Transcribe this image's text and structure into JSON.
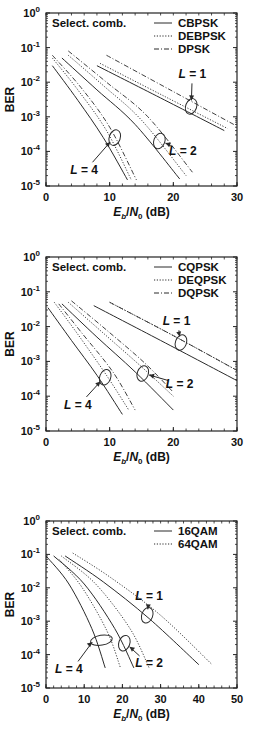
{
  "chart_data": [
    {
      "type": "line",
      "id": "bpsk",
      "annotation": "Select. comb.",
      "xlabel": "E_b/N_0 (dB)",
      "ylabel": "BER",
      "xlim": [
        0,
        30
      ],
      "ylim": [
        1e-05,
        1
      ],
      "yscale": "log",
      "xticks": [
        0,
        10,
        20,
        30
      ],
      "yticks_exp": [
        0,
        -1,
        -2,
        -3,
        -4,
        -5
      ],
      "grid": false,
      "legend_position": "upper right",
      "legend": [
        {
          "name": "CBPSK",
          "style": "solid"
        },
        {
          "name": "DEBPSK",
          "style": "dotted"
        },
        {
          "name": "DPSK",
          "style": "dashdot"
        }
      ],
      "series": [
        {
          "name": "CBPSK",
          "L": 1,
          "style": "solid",
          "points": [
            [
              8,
              0.03
            ],
            [
              18,
              0.0035
            ],
            [
              28,
              0.0004
            ]
          ]
        },
        {
          "name": "DEBPSK",
          "L": 1,
          "style": "dotted",
          "points": [
            [
              8.5,
              0.035
            ],
            [
              18.5,
              0.004
            ],
            [
              28.5,
              0.00046
            ]
          ]
        },
        {
          "name": "DPSK",
          "L": 1,
          "style": "dashdot",
          "points": [
            [
              9.5,
              0.06
            ],
            [
              19.5,
              0.006
            ],
            [
              29.5,
              0.0006
            ]
          ]
        },
        {
          "name": "CBPSK",
          "L": 2,
          "style": "solid",
          "points": [
            [
              2.5,
              0.05
            ],
            [
              8,
              0.006
            ],
            [
              14,
              0.0006
            ],
            [
              21,
              1.6e-05
            ]
          ]
        },
        {
          "name": "DEBPSK",
          "L": 2,
          "style": "dotted",
          "points": [
            [
              3.5,
              0.06
            ],
            [
              9,
              0.008
            ],
            [
              15,
              0.0008
            ],
            [
              22,
              2e-05
            ]
          ]
        },
        {
          "name": "DPSK",
          "L": 2,
          "style": "dashdot",
          "points": [
            [
              3.5,
              0.08
            ],
            [
              9.5,
              0.01
            ],
            [
              16,
              0.001
            ],
            [
              23,
              2.5e-05
            ]
          ]
        },
        {
          "name": "CBPSK",
          "L": 4,
          "style": "solid",
          "points": [
            [
              1,
              0.03
            ],
            [
              5,
              0.003
            ],
            [
              9,
              0.00025
            ],
            [
              12.8,
              1.5e-05
            ]
          ]
        },
        {
          "name": "DEBPSK",
          "L": 4,
          "style": "dotted",
          "points": [
            [
              1,
              0.05
            ],
            [
              5,
              0.006
            ],
            [
              9.5,
              0.0004
            ],
            [
              13.4,
              1.5e-05
            ]
          ]
        },
        {
          "name": "DPSK",
          "L": 4,
          "style": "dashdot",
          "points": [
            [
              1,
              0.06
            ],
            [
              5.5,
              0.007
            ],
            [
              10,
              0.0005
            ],
            [
              14.2,
              1.5e-05
            ]
          ]
        }
      ],
      "annotations": [
        {
          "text": "L = 1",
          "x": 23,
          "y": 0.018,
          "ellipse_at": [
            22.8,
            0.002
          ]
        },
        {
          "text": "L = 2",
          "x": 21.5,
          "y": 0.00011,
          "ellipse_at": [
            17.8,
            0.0002
          ]
        },
        {
          "text": "L = 4",
          "x": 6,
          "y": 3e-05,
          "ellipse_at": [
            10.8,
            0.00025
          ]
        }
      ]
    },
    {
      "type": "line",
      "id": "qpsk",
      "annotation": "Select. comb.",
      "xlabel": "E_b/N_0 (dB)",
      "ylabel": "BER",
      "xlim": [
        0,
        30
      ],
      "ylim": [
        1e-05,
        1
      ],
      "yscale": "log",
      "xticks": [
        0,
        10,
        20,
        30
      ],
      "yticks_exp": [
        0,
        -1,
        -2,
        -3,
        -4,
        -5
      ],
      "grid": false,
      "legend_position": "upper right",
      "legend": [
        {
          "name": "CQPSK",
          "style": "solid"
        },
        {
          "name": "DEQPSK",
          "style": "dotted"
        },
        {
          "name": "DQPSK",
          "style": "dashdot"
        }
      ],
      "series": [
        {
          "name": "CQPSK",
          "L": 1,
          "style": "solid",
          "points": [
            [
              7.5,
              0.04
            ],
            [
              18,
              0.004
            ],
            [
              30,
              0.00028
            ]
          ]
        },
        {
          "name": "DEQPSK",
          "L": 1,
          "style": "dotted",
          "points": [
            [
              10,
              0.05
            ],
            [
              20,
              0.0055
            ],
            [
              30,
              0.00055
            ]
          ]
        },
        {
          "name": "DQPSK",
          "L": 1,
          "style": "dashdot",
          "points": [
            [
              10,
              0.05
            ],
            [
              20,
              0.0055
            ],
            [
              30,
              0.00055
            ]
          ]
        },
        {
          "name": "CQPSK",
          "L": 2,
          "style": "solid",
          "points": [
            [
              2.5,
              0.045
            ],
            [
              8,
              0.005
            ],
            [
              14,
              0.0005
            ],
            [
              20,
              4e-05
            ]
          ]
        },
        {
          "name": "DEQPSK",
          "L": 2,
          "style": "dotted",
          "points": [
            [
              3.5,
              0.05
            ],
            [
              9,
              0.0065
            ],
            [
              15,
              0.0007
            ],
            [
              20,
              0.0001
            ]
          ]
        },
        {
          "name": "DQPSK",
          "L": 2,
          "style": "dashdot",
          "points": [
            [
              4,
              0.055
            ],
            [
              9.5,
              0.008
            ],
            [
              15.5,
              0.0009
            ],
            [
              20,
              0.00013
            ]
          ]
        },
        {
          "name": "CQPSK",
          "L": 4,
          "style": "solid",
          "points": [
            [
              0.3,
              0.035
            ],
            [
              4,
              0.004
            ],
            [
              8,
              0.0004
            ],
            [
              12,
              3e-05
            ]
          ]
        },
        {
          "name": "DEQPSK",
          "L": 4,
          "style": "dotted",
          "points": [
            [
              1.3,
              0.05
            ],
            [
              5,
              0.006
            ],
            [
              9.5,
              0.0004
            ],
            [
              13,
              4e-05
            ]
          ]
        },
        {
          "name": "DQPSK",
          "L": 4,
          "style": "dashdot",
          "points": [
            [
              2,
              0.045
            ],
            [
              5.5,
              0.007
            ],
            [
              10.5,
              0.0005
            ],
            [
              14,
              4e-05
            ]
          ]
        }
      ],
      "annotations": [
        {
          "text": "L = 1",
          "x": 20.5,
          "y": 0.015,
          "ellipse_at": [
            21.2,
            0.0035
          ]
        },
        {
          "text": "L = 2",
          "x": 21,
          "y": 0.00024,
          "ellipse_at": [
            15.2,
            0.00045
          ]
        },
        {
          "text": "L = 4",
          "x": 5,
          "y": 6e-05,
          "ellipse_at": [
            9.3,
            0.00035
          ]
        }
      ]
    },
    {
      "type": "line",
      "id": "qam",
      "annotation": "Select. comb.",
      "xlabel": "E_b/N_0 (dB)",
      "ylabel": "BER",
      "xlim": [
        0,
        50
      ],
      "ylim": [
        1e-05,
        1
      ],
      "yscale": "log",
      "xticks": [
        0,
        10,
        20,
        30,
        40,
        50
      ],
      "yticks_exp": [
        0,
        -1,
        -2,
        -3,
        -4,
        -5
      ],
      "grid": false,
      "legend_position": "upper right",
      "legend": [
        {
          "name": "16QAM",
          "style": "solid"
        },
        {
          "name": "64QAM",
          "style": "dotted"
        }
      ],
      "series": [
        {
          "name": "16QAM",
          "L": 1,
          "style": "solid",
          "points": [
            [
              5,
              0.09
            ],
            [
              15,
              0.015
            ],
            [
              27,
              0.0012
            ],
            [
              40,
              5e-05
            ]
          ]
        },
        {
          "name": "64QAM",
          "L": 1,
          "style": "dotted",
          "points": [
            [
              7,
              0.11
            ],
            [
              17,
              0.02
            ],
            [
              30,
              0.0015
            ],
            [
              43.5,
              5e-05
            ]
          ]
        },
        {
          "name": "16QAM",
          "L": 2,
          "style": "solid",
          "points": [
            [
              2,
              0.09
            ],
            [
              10,
              0.013
            ],
            [
              18,
              0.0006
            ],
            [
              23,
              4e-05
            ]
          ]
        },
        {
          "name": "64QAM",
          "L": 2,
          "style": "dotted",
          "points": [
            [
              4,
              0.09
            ],
            [
              13,
              0.013
            ],
            [
              22,
              0.0006
            ],
            [
              27,
              4e-05
            ]
          ]
        },
        {
          "name": "16QAM",
          "L": 4,
          "style": "solid",
          "points": [
            [
              0,
              0.09
            ],
            [
              6,
              0.013
            ],
            [
              12,
              0.0006
            ],
            [
              15.5,
              4e-05
            ]
          ]
        },
        {
          "name": "64QAM",
          "L": 4,
          "style": "dotted",
          "points": [
            [
              3.5,
              0.07
            ],
            [
              9.5,
              0.01
            ],
            [
              16,
              0.0005
            ],
            [
              19.5,
              4e-05
            ]
          ]
        }
      ],
      "annotations": [
        {
          "text": "L = 1",
          "x": 27,
          "y": 0.006,
          "ellipse_at": [
            26.5,
            0.0015
          ]
        },
        {
          "text": "L = 2",
          "x": 27,
          "y": 6e-05,
          "ellipse_at": [
            20.5,
            0.00022
          ]
        },
        {
          "text": "L = 4",
          "x": 6,
          "y": 4e-05,
          "ellipse_at": [
            14.5,
            0.00027
          ]
        }
      ]
    }
  ],
  "labels": {
    "ylabel": "BER",
    "xlabel_E": "E",
    "xlabel_b": "b",
    "xlabel_slash": "/",
    "xlabel_N": "N",
    "xlabel_0": "0",
    "xlabel_unit": " (dB)",
    "tick_base": "10"
  },
  "colors": {
    "line": "#2a2a2a",
    "axis": "#222222",
    "background": "#ffffff"
  }
}
